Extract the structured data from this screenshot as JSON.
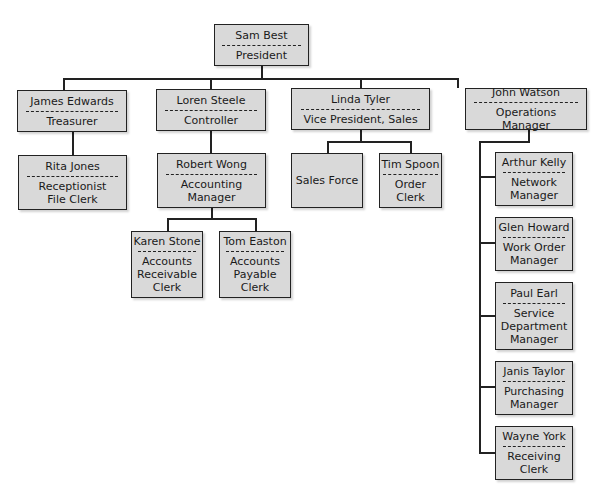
{
  "chart": {
    "caption": "FIGURE",
    "root": {
      "name": "Sam Best",
      "title": "President"
    },
    "level1": [
      {
        "name": "James Edwards",
        "title": "Treasurer"
      },
      {
        "name": "Loren Steele",
        "title": "Controller"
      },
      {
        "name": "Linda Tyler",
        "title": "Vice President, Sales"
      },
      {
        "name": "John Watson",
        "title": "Operations Manager"
      }
    ],
    "treasurer_reports": [
      {
        "name": "Rita Jones",
        "title": "Receptionist\nFile Clerk"
      }
    ],
    "controller_reports": [
      {
        "name": "Robert Wong",
        "title": "Accounting\nManager"
      }
    ],
    "accounting_reports": [
      {
        "name": "Karen Stone",
        "title": "Accounts\nReceivable\nClerk"
      },
      {
        "name": "Tom Easton",
        "title": "Accounts\nPayable\nClerk"
      }
    ],
    "sales_reports": [
      {
        "name": "Sales Force",
        "title": ""
      },
      {
        "name": "Tim Spoon",
        "title": "Order Clerk"
      }
    ],
    "operations_reports": [
      {
        "name": "Arthur Kelly",
        "title": "Network\nManager"
      },
      {
        "name": "Glen Howard",
        "title": "Work Order\nManager"
      },
      {
        "name": "Paul Earl",
        "title": "Service\nDepartment\nManager"
      },
      {
        "name": "Janis Taylor",
        "title": "Purchasing\nManager"
      },
      {
        "name": "Wayne York",
        "title": "Receiving\nClerk"
      }
    ]
  },
  "colors": {
    "box_fill": "#d9d9d9",
    "border": "#222222",
    "background": "#ffffff"
  }
}
